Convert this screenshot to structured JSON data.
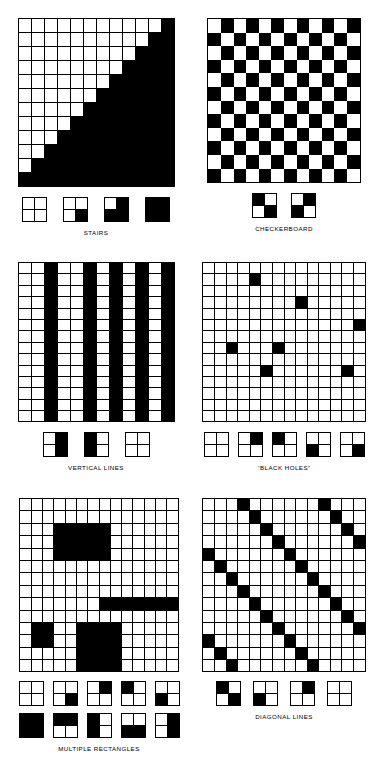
{
  "page": {
    "background_color": "#ffffff",
    "ink_color": "#000000",
    "panel_count": 6
  },
  "panels": [
    {
      "id": "stairs",
      "caption": "STAIRS",
      "grid": {
        "rows": 12,
        "cols": 12,
        "gridlines": true,
        "description": "lower-right triangle filled black below the anti-diagonal staircase",
        "cells": [
          [
            0,
            0,
            0,
            0,
            0,
            0,
            0,
            0,
            0,
            0,
            0,
            1
          ],
          [
            0,
            0,
            0,
            0,
            0,
            0,
            0,
            0,
            0,
            0,
            1,
            1
          ],
          [
            0,
            0,
            0,
            0,
            0,
            0,
            0,
            0,
            0,
            1,
            1,
            1
          ],
          [
            0,
            0,
            0,
            0,
            0,
            0,
            0,
            0,
            1,
            1,
            1,
            1
          ],
          [
            0,
            0,
            0,
            0,
            0,
            0,
            0,
            1,
            1,
            1,
            1,
            1
          ],
          [
            0,
            0,
            0,
            0,
            0,
            0,
            1,
            1,
            1,
            1,
            1,
            1
          ],
          [
            0,
            0,
            0,
            0,
            0,
            1,
            1,
            1,
            1,
            1,
            1,
            1
          ],
          [
            0,
            0,
            0,
            0,
            1,
            1,
            1,
            1,
            1,
            1,
            1,
            1
          ],
          [
            0,
            0,
            0,
            1,
            1,
            1,
            1,
            1,
            1,
            1,
            1,
            1
          ],
          [
            0,
            0,
            1,
            1,
            1,
            1,
            1,
            1,
            1,
            1,
            1,
            1
          ],
          [
            0,
            1,
            1,
            1,
            1,
            1,
            1,
            1,
            1,
            1,
            1,
            1
          ],
          [
            1,
            1,
            1,
            1,
            1,
            1,
            1,
            1,
            1,
            1,
            1,
            1
          ]
        ]
      },
      "tiles": [
        {
          "name": "all-white",
          "q": [
            0,
            0,
            0,
            0
          ]
        },
        {
          "name": "bottom-right-black",
          "q": [
            0,
            0,
            0,
            1
          ]
        },
        {
          "name": "three-black-top-left-white",
          "q": [
            0,
            1,
            1,
            1
          ]
        },
        {
          "name": "all-black",
          "q": [
            1,
            1,
            1,
            1
          ]
        }
      ]
    },
    {
      "id": "checkerboard",
      "caption": "CHECKERBOARD",
      "grid": {
        "rows": 12,
        "cols": 12,
        "gridlines": false,
        "description": "alternating black and white cells, top-left white",
        "cells": [
          [
            0,
            1,
            0,
            1,
            0,
            1,
            0,
            1,
            0,
            1,
            0,
            1
          ],
          [
            1,
            0,
            1,
            0,
            1,
            0,
            1,
            0,
            1,
            0,
            1,
            0
          ],
          [
            0,
            1,
            0,
            1,
            0,
            1,
            0,
            1,
            0,
            1,
            0,
            1
          ],
          [
            1,
            0,
            1,
            0,
            1,
            0,
            1,
            0,
            1,
            0,
            1,
            0
          ],
          [
            0,
            1,
            0,
            1,
            0,
            1,
            0,
            1,
            0,
            1,
            0,
            1
          ],
          [
            1,
            0,
            1,
            0,
            1,
            0,
            1,
            0,
            1,
            0,
            1,
            0
          ],
          [
            0,
            1,
            0,
            1,
            0,
            1,
            0,
            1,
            0,
            1,
            0,
            1
          ],
          [
            1,
            0,
            1,
            0,
            1,
            0,
            1,
            0,
            1,
            0,
            1,
            0
          ],
          [
            0,
            1,
            0,
            1,
            0,
            1,
            0,
            1,
            0,
            1,
            0,
            1
          ],
          [
            1,
            0,
            1,
            0,
            1,
            0,
            1,
            0,
            1,
            0,
            1,
            0
          ],
          [
            0,
            1,
            0,
            1,
            0,
            1,
            0,
            1,
            0,
            1,
            0,
            1
          ],
          [
            1,
            0,
            1,
            0,
            1,
            0,
            1,
            0,
            1,
            0,
            1,
            0
          ]
        ]
      },
      "tiles": [
        {
          "name": "black-white-white-black",
          "q": [
            1,
            0,
            0,
            1
          ]
        },
        {
          "name": "white-black-black-white",
          "q": [
            0,
            1,
            1,
            0
          ]
        }
      ]
    },
    {
      "id": "vertical-lines",
      "caption": "VERTICAL LINES",
      "grid": {
        "rows": 14,
        "cols": 12,
        "gridlines": true,
        "description": "full-height black columns at indices 2, 5, 7, 9 and 11",
        "black_columns": [
          2,
          5,
          7,
          9,
          11
        ]
      },
      "tiles": [
        {
          "name": "right-half-black",
          "q": [
            0,
            1,
            0,
            1
          ]
        },
        {
          "name": "left-half-black",
          "q": [
            1,
            0,
            1,
            0
          ]
        },
        {
          "name": "all-white",
          "q": [
            0,
            0,
            0,
            0
          ]
        }
      ]
    },
    {
      "id": "black-holes",
      "caption": "“BLACK HOLES”",
      "grid": {
        "rows": 14,
        "cols": 14,
        "gridlines": true,
        "description": "isolated single black cells scattered on a white grid",
        "black_cells": [
          [
            1,
            4
          ],
          [
            3,
            8
          ],
          [
            5,
            13
          ],
          [
            7,
            2
          ],
          [
            7,
            6
          ],
          [
            9,
            5
          ],
          [
            9,
            12
          ]
        ]
      },
      "tiles": [
        {
          "name": "all-white",
          "q": [
            0,
            0,
            0,
            0
          ]
        },
        {
          "name": "top-right-black",
          "q": [
            0,
            1,
            0,
            0
          ]
        },
        {
          "name": "top-left-black",
          "q": [
            1,
            0,
            0,
            0
          ]
        },
        {
          "name": "bottom-left-black",
          "q": [
            0,
            0,
            1,
            0
          ]
        },
        {
          "name": "bottom-right-black",
          "q": [
            0,
            0,
            0,
            1
          ]
        }
      ]
    },
    {
      "id": "multiple-rectangles",
      "caption": "MULTIPLE RECTANGLES",
      "grid": {
        "rows": 14,
        "cols": 14,
        "gridlines": true,
        "description": "four solid black rectangles of differing sizes on a white grid",
        "rectangles": [
          {
            "name": "large-upper-rectangle",
            "row": 2,
            "col": 3,
            "height": 3,
            "width": 5
          },
          {
            "name": "horizontal-bar",
            "row": 8,
            "col": 7,
            "height": 1,
            "width": 7
          },
          {
            "name": "small-square",
            "row": 10,
            "col": 1,
            "height": 2,
            "width": 2
          },
          {
            "name": "lower-rectangle",
            "row": 10,
            "col": 5,
            "height": 4,
            "width": 4
          }
        ]
      },
      "tiles_row1": [
        {
          "name": "all-white",
          "q": [
            0,
            0,
            0,
            0
          ]
        },
        {
          "name": "bottom-right-black",
          "q": [
            0,
            0,
            0,
            1
          ]
        },
        {
          "name": "top-right-black",
          "q": [
            0,
            1,
            0,
            0
          ]
        },
        {
          "name": "top-left-black",
          "q": [
            1,
            0,
            0,
            0
          ]
        },
        {
          "name": "bottom-left-black",
          "q": [
            0,
            0,
            1,
            0
          ]
        }
      ],
      "tiles_row2": [
        {
          "name": "all-black",
          "q": [
            1,
            1,
            1,
            1
          ]
        },
        {
          "name": "top-half-black",
          "q": [
            1,
            1,
            0,
            0
          ]
        },
        {
          "name": "left-half-black",
          "q": [
            1,
            0,
            1,
            0
          ]
        },
        {
          "name": "bottom-half-black",
          "q": [
            0,
            0,
            1,
            1
          ]
        },
        {
          "name": "right-half-black",
          "q": [
            0,
            1,
            0,
            1
          ]
        }
      ]
    },
    {
      "id": "diagonal-lines",
      "caption": "DIAGONAL LINES",
      "grid": {
        "rows": 14,
        "cols": 14,
        "gridlines": true,
        "description": "black cells on down-right diagonals repeating every 7 columns",
        "rule": "(col - row) mod 7 == 3",
        "period": 7,
        "offset": 3
      },
      "tiles": [
        {
          "name": "diagonal-top-left-bottom-right",
          "q": [
            1,
            0,
            0,
            1
          ]
        },
        {
          "name": "bottom-left-black",
          "q": [
            0,
            0,
            1,
            0
          ]
        },
        {
          "name": "top-right-black",
          "q": [
            0,
            1,
            0,
            0
          ]
        },
        {
          "name": "all-white",
          "q": [
            0,
            0,
            0,
            0
          ]
        }
      ]
    }
  ]
}
